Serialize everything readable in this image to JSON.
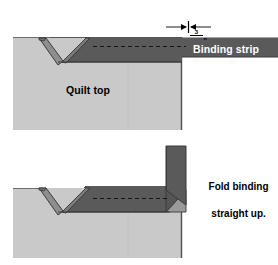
{
  "figure": {
    "type": "quilt-binding-instruction-diagram",
    "background_color": "#ffffff",
    "colors": {
      "quilt_top": "#c9c9c9",
      "quilt_top_shade": "#c2c2c2",
      "binding_strip": "#5a5a5a",
      "binding_strip_light": "#8e8e8e",
      "binding_strip_dark": "#4a4a4a",
      "outline": "#3a3a3a",
      "stitch_line": "#1d1d1d",
      "label_light": "#ffffff",
      "label_dark": "#000000"
    }
  },
  "measurement": {
    "numerator": "3",
    "denominator": "8",
    "unit_mark": "\"",
    "full_text": "3/8\"",
    "arrow_left": "left-arrow-marker",
    "arrow_right": "right-arrow-marker"
  },
  "top_panel": {
    "labels": {
      "binding_strip": "Binding strip",
      "quilt_top": "Quilt top"
    },
    "stitch_line": "dashed-stitch-line"
  },
  "bottom_panel": {
    "labels": {
      "instruction_line_1": "Fold binding",
      "instruction_line_2": "straight up.",
      "instruction_full": "Fold binding straight up."
    },
    "stitch_line": "dashed-stitch-line"
  }
}
